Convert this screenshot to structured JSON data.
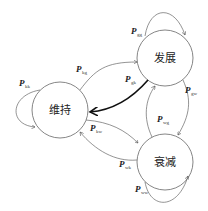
{
  "nodes": {
    "develop": {
      "label": "发展"
    },
    "maintain": {
      "label": "维持"
    },
    "decline": {
      "label": "衰减"
    }
  },
  "edges": {
    "gg": {
      "p": "P",
      "sub": "gg"
    },
    "kk": {
      "p": "P",
      "sub": "kk"
    },
    "kg": {
      "p": "P",
      "sub": "kg"
    },
    "gk": {
      "p": "P",
      "sub": "gk"
    },
    "gw": {
      "p": "P",
      "sub": "gw"
    },
    "wg": {
      "p": "P",
      "sub": "wg"
    },
    "kw": {
      "p": "P",
      "sub": "kw"
    },
    "wk": {
      "p": "P",
      "sub": "wk"
    },
    "ww": {
      "p": "P",
      "sub": "ww"
    }
  }
}
